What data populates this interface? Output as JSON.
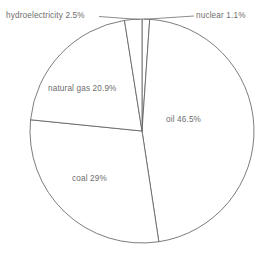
{
  "chart_data": {
    "type": "pie",
    "title": "",
    "subtitle": "",
    "xlabel": "",
    "ylabel": "",
    "legend_position": "none",
    "grid": false,
    "labels_on_slices": true,
    "categories": [
      "nuclear",
      "oil",
      "coal",
      "natural gas",
      "hydroelectricity"
    ],
    "values": [
      1.1,
      46.5,
      29.0,
      20.9,
      2.5
    ],
    "units": "%",
    "start_angle_deg": 90,
    "direction": "clockwise",
    "slices": [
      {
        "name": "nuclear",
        "value": 1.1,
        "label": "nuclear 1.1%",
        "label_placement": "outside-right",
        "has_leader_line": true,
        "fill": "#ffffff",
        "stroke": "#5a5a5a"
      },
      {
        "name": "oil",
        "value": 46.5,
        "label": "oil 46.5%",
        "label_placement": "inside",
        "has_leader_line": false,
        "fill": "#ffffff",
        "stroke": "#5a5a5a"
      },
      {
        "name": "coal",
        "value": 29.0,
        "label": "coal 29%",
        "label_placement": "inside",
        "has_leader_line": false,
        "fill": "#ffffff",
        "stroke": "#5a5a5a"
      },
      {
        "name": "natural gas",
        "value": 20.9,
        "label": "natural gas 20.9%",
        "label_placement": "inside",
        "has_leader_line": false,
        "fill": "#ffffff",
        "stroke": "#5a5a5a"
      },
      {
        "name": "hydroelectricity",
        "value": 2.5,
        "label": "hydroelectricity 2.5%",
        "label_placement": "outside-left",
        "has_leader_line": true,
        "fill": "#ffffff",
        "stroke": "#5a5a5a"
      }
    ],
    "geometry": {
      "center_x": 142,
      "center_y": 131,
      "radius": 112
    },
    "colors": {
      "background": "#ffffff",
      "slice_fill": "#ffffff",
      "slice_outline": "#5a5a5a",
      "label_text": "#6d6d6d",
      "leader_line": "#6f6f6f"
    }
  },
  "labels": {
    "hydroelectricity": "hydroelectricity 2.5%",
    "nuclear": "nuclear 1.1%",
    "natural_gas": "natural gas 20.9%",
    "oil": "oil 46.5%",
    "coal": "coal 29%"
  }
}
